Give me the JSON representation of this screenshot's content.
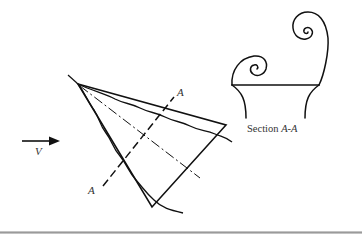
{
  "figure": {
    "velocity_label": "V",
    "section_marker_top": "A",
    "section_marker_bottom": "A",
    "section_caption_prefix": "Section ",
    "section_caption_name": "A-A",
    "colors": {
      "stroke": "#111111",
      "text": "#333333",
      "rule": "#9a9a9a"
    }
  }
}
